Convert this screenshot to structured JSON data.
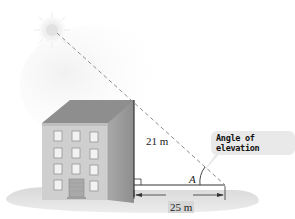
{
  "figure": {
    "labels": {
      "height": "21 m",
      "base": "25 m",
      "angle": "A",
      "callout": "Angle of elevation"
    },
    "elements": [
      "sun",
      "building",
      "sight-line",
      "right-angle-marker",
      "base-dimension-arrow",
      "angle-arc",
      "ground-shadow"
    ],
    "colors": {
      "building_front": "#c9c9c9",
      "building_side": "#9a9a9a",
      "roof": "#8c8c8c",
      "ground": "#d4d4d4",
      "dashed_line": "#777777",
      "callout_bg": "#e9e9e9"
    },
    "geometry": {
      "height_m": 21,
      "base_m": 25,
      "right_angle_at": "base of building",
      "angle_at": "end of base, opposite building"
    }
  }
}
